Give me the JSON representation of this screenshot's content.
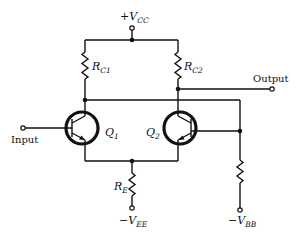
{
  "diagram": {
    "type": "circuit-schematic",
    "colors": {
      "ink": "#111111",
      "background": "#ffffff"
    },
    "labels": {
      "vcc": {
        "sign": "+",
        "main": "V",
        "sub": "CC"
      },
      "vee": {
        "sign": "−",
        "main": "V",
        "sub": "EE"
      },
      "vbb": {
        "sign": "−",
        "main": "V",
        "sub": "BB"
      },
      "rc1": {
        "main": "R",
        "sub": "C1"
      },
      "rc2": {
        "main": "R",
        "sub": "C2"
      },
      "re": {
        "main": "R",
        "sub": "E"
      },
      "q1": {
        "main": "Q",
        "sub": "1"
      },
      "q2": {
        "main": "Q",
        "sub": "2"
      },
      "input": "Input",
      "output": "Output"
    },
    "components": [
      {
        "id": "RC1",
        "kind": "resistor",
        "label": "R_C1"
      },
      {
        "id": "RC2",
        "kind": "resistor",
        "label": "R_C2"
      },
      {
        "id": "RE",
        "kind": "resistor",
        "label": "R_E"
      },
      {
        "id": "RB",
        "kind": "resistor",
        "label": ""
      },
      {
        "id": "Q1",
        "kind": "npn-transistor",
        "label": "Q_1"
      },
      {
        "id": "Q2",
        "kind": "npn-transistor",
        "label": "Q_2"
      }
    ],
    "terminals": [
      "+V_CC",
      "-V_EE",
      "-V_BB",
      "Input",
      "Output"
    ]
  }
}
